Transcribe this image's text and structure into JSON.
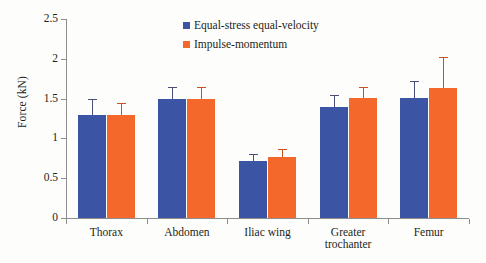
{
  "chart_data": {
    "type": "bar",
    "title": "",
    "xlabel": "",
    "ylabel": "Force (kN)",
    "ylim": [
      0,
      2.5
    ],
    "yticks": [
      "0",
      "0.5",
      "1",
      "1.5",
      "2",
      "2.5"
    ],
    "ytick_values": [
      0,
      0.5,
      1,
      1.5,
      2,
      2.5
    ],
    "grid": false,
    "legend_position": "top-center",
    "categories": [
      "Thorax",
      "Abdomen",
      "Iliac wing",
      "Greater trochanter",
      "Femur"
    ],
    "category_lines": [
      [
        "Thorax"
      ],
      [
        "Abdomen"
      ],
      [
        "Iliac wing"
      ],
      [
        "Greater",
        "trochanter"
      ],
      [
        "Femur"
      ]
    ],
    "series": [
      {
        "name": "Equal-stress equal-velocity",
        "color": "#3b55a4",
        "values": [
          1.3,
          1.5,
          0.71,
          1.39,
          1.51
        ],
        "errors": [
          0.2,
          0.14,
          0.09,
          0.16,
          0.21
        ]
      },
      {
        "name": "Impulse-momentum",
        "color": "#f4682c",
        "values": [
          1.3,
          1.5,
          0.77,
          1.51,
          1.63
        ],
        "errors": [
          0.15,
          0.14,
          0.1,
          0.13,
          0.39
        ]
      }
    ]
  },
  "legend": {
    "entries": [
      {
        "label": "Equal-stress equal-velocity",
        "color": "#3b55a4"
      },
      {
        "label": "Impulse-momentum",
        "color": "#f4682c"
      }
    ]
  },
  "axes": {
    "y_title": "Force (kN)"
  }
}
